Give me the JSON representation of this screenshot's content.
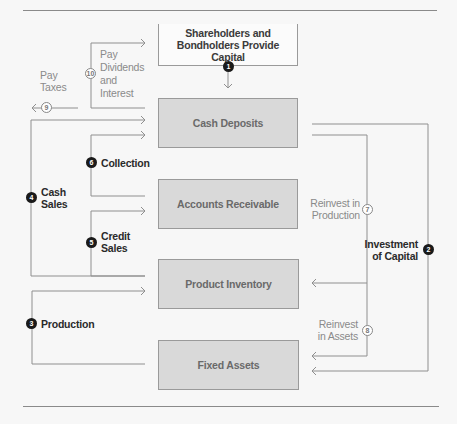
{
  "boxes": {
    "shareholders": "Shareholders and Bondholders Provide Capital",
    "cash_deposits": "Cash Deposits",
    "accounts_receivable": "Accounts Receivable",
    "product_inventory": "Product Inventory",
    "fixed_assets": "Fixed Assets"
  },
  "flows": [
    {
      "number": "1",
      "label": "",
      "style": "dark"
    },
    {
      "number": "2",
      "label": "Investment of Capital",
      "style": "dark"
    },
    {
      "number": "3",
      "label": "Production",
      "style": "dark"
    },
    {
      "number": "4",
      "label": "Cash Sales",
      "style": "dark"
    },
    {
      "number": "5",
      "label": "Credit Sales",
      "style": "dark"
    },
    {
      "number": "6",
      "label": "Collection",
      "style": "dark"
    },
    {
      "number": "7",
      "label": "Reinvest in Production",
      "style": "outline"
    },
    {
      "number": "8",
      "label": "Reinvest in Assets",
      "style": "outline"
    },
    {
      "number": "9",
      "label": "Pay Taxes",
      "style": "outline"
    },
    {
      "number": "10",
      "label": "Pay Dividends and Interest",
      "style": "outline"
    }
  ],
  "labels": {
    "pay_taxes_1": "Pay",
    "pay_taxes_2": "Taxes",
    "dividends_1": "Pay",
    "dividends_2": "Dividends",
    "dividends_3": "and",
    "dividends_4": "Interest",
    "collection": "Collection",
    "cash_sales_1": "Cash",
    "cash_sales_2": "Sales",
    "credit_sales_1": "Credit",
    "credit_sales_2": "Sales",
    "production": "Production",
    "reinvest_prod_1": "Reinvest in",
    "reinvest_prod_2": "Production",
    "investment_1": "Investment",
    "investment_2": "of Capital",
    "reinvest_assets_1": "Reinvest",
    "reinvest_assets_2": "in Assets"
  }
}
